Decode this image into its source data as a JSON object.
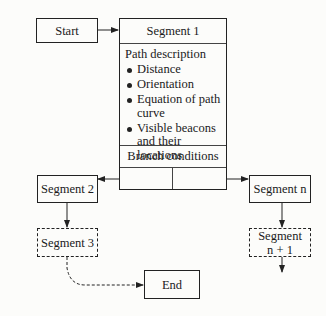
{
  "diagram": {
    "start": "Start",
    "segment1": {
      "title": "Segment 1",
      "path_description_label": "Path description",
      "bullets": [
        "Distance",
        "Orientation",
        "Equation of path curve",
        "Visible beacons and their locations"
      ],
      "branch_conditions_label": "Branch conditions"
    },
    "segment2": "Segment 2",
    "segment3": "Segment 3",
    "segment_n": "Segment n",
    "segment_n1_line1": "Segment",
    "segment_n1_line2": "n + 1",
    "end": "End"
  }
}
